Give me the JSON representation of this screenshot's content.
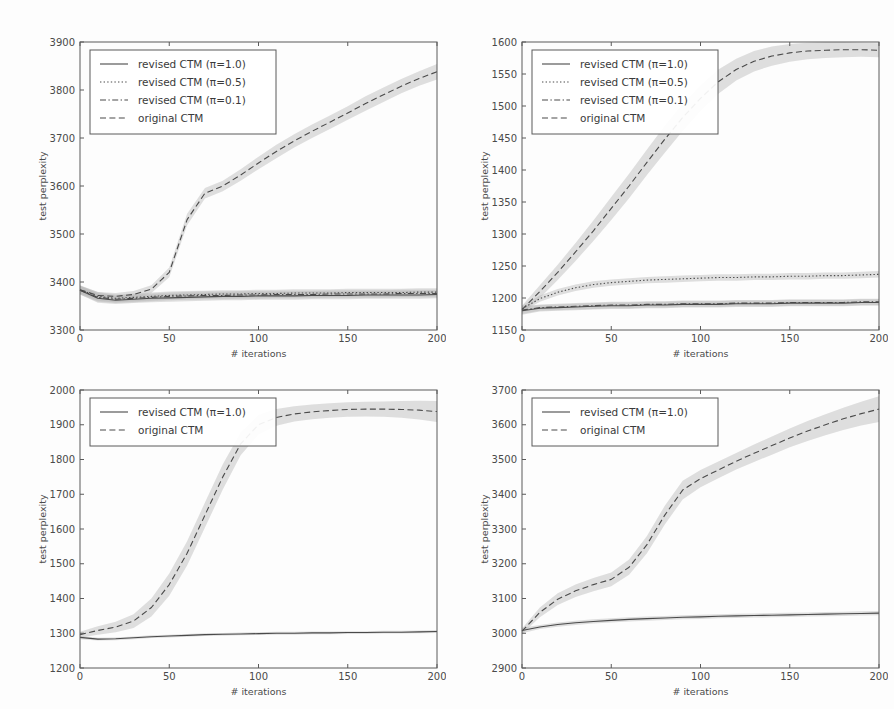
{
  "figure": {
    "background": "#fdfdfd",
    "ink_color": "#4a4a4a",
    "band_color": "#b9b9b9",
    "layout": "2x2 grid of line charts"
  },
  "axis": {
    "xlabel": "# iterations",
    "ylabel": "test perplexity",
    "xticks": [
      "0",
      "50",
      "100",
      "150",
      "200"
    ],
    "xlim": [
      0,
      200
    ]
  },
  "legend_labels": {
    "revised_1_0": "revised CTM (π=1.0)",
    "revised_0_5": "revised CTM (π=0.5)",
    "revised_0_1": "revised CTM (π=0.1)",
    "original": "original CTM"
  },
  "chart_data": [
    {
      "id": "panel-top-left",
      "type": "line",
      "title": "",
      "xlabel": "# iterations",
      "ylabel": "test perplexity",
      "xlim": [
        0,
        200
      ],
      "ylim": [
        3300,
        3900
      ],
      "xticks": [
        0,
        50,
        100,
        150,
        200
      ],
      "yticks": [
        3300,
        3400,
        3500,
        3600,
        3700,
        3800,
        3900
      ],
      "grid": false,
      "legend_position": "upper left",
      "x": [
        0,
        10,
        20,
        30,
        40,
        50,
        60,
        70,
        80,
        90,
        100,
        110,
        120,
        130,
        140,
        150,
        160,
        170,
        180,
        190,
        200
      ],
      "series": [
        {
          "name": "revised CTM (π=1.0)",
          "style": "solid",
          "values": [
            3383,
            3366,
            3362,
            3364,
            3366,
            3367,
            3368,
            3369,
            3370,
            3370,
            3371,
            3371,
            3371,
            3372,
            3372,
            3372,
            3373,
            3373,
            3373,
            3373,
            3374
          ],
          "band_lower": [
            3374,
            3357,
            3354,
            3356,
            3358,
            3359,
            3360,
            3361,
            3362,
            3362,
            3363,
            3363,
            3363,
            3364,
            3364,
            3364,
            3365,
            3365,
            3365,
            3365,
            3366
          ],
          "band_upper": [
            3392,
            3375,
            3370,
            3372,
            3374,
            3375,
            3376,
            3377,
            3378,
            3378,
            3379,
            3379,
            3379,
            3380,
            3380,
            3380,
            3381,
            3381,
            3381,
            3381,
            3382
          ]
        },
        {
          "name": "revised CTM (π=0.5)",
          "style": "dotted",
          "values": [
            3384,
            3370,
            3366,
            3368,
            3370,
            3372,
            3373,
            3374,
            3375,
            3375,
            3376,
            3376,
            3377,
            3377,
            3377,
            3378,
            3378,
            3378,
            3378,
            3379,
            3379
          ],
          "band_lower": [
            3375,
            3361,
            3358,
            3360,
            3362,
            3364,
            3365,
            3366,
            3367,
            3367,
            3368,
            3368,
            3369,
            3369,
            3369,
            3370,
            3370,
            3370,
            3370,
            3371,
            3371
          ],
          "band_upper": [
            3393,
            3379,
            3374,
            3376,
            3378,
            3380,
            3381,
            3382,
            3383,
            3383,
            3384,
            3384,
            3385,
            3385,
            3385,
            3386,
            3386,
            3386,
            3386,
            3387,
            3387
          ]
        },
        {
          "name": "revised CTM (π=0.1)",
          "style": "dashdot",
          "values": [
            3383,
            3368,
            3364,
            3366,
            3368,
            3370,
            3371,
            3372,
            3372,
            3373,
            3373,
            3374,
            3374,
            3374,
            3375,
            3375,
            3375,
            3375,
            3376,
            3376,
            3376
          ],
          "band_lower": [
            3374,
            3359,
            3356,
            3358,
            3360,
            3362,
            3363,
            3364,
            3364,
            3365,
            3365,
            3366,
            3366,
            3366,
            3367,
            3367,
            3367,
            3367,
            3368,
            3368,
            3368
          ],
          "band_upper": [
            3392,
            3377,
            3372,
            3374,
            3376,
            3378,
            3379,
            3380,
            3380,
            3381,
            3381,
            3382,
            3382,
            3382,
            3383,
            3383,
            3383,
            3383,
            3384,
            3384,
            3384
          ]
        },
        {
          "name": "original CTM",
          "style": "dashed",
          "values": [
            3384,
            3372,
            3370,
            3374,
            3385,
            3420,
            3530,
            3585,
            3600,
            3623,
            3648,
            3672,
            3694,
            3714,
            3733,
            3752,
            3772,
            3790,
            3808,
            3824,
            3838
          ],
          "band_lower": [
            3376,
            3365,
            3363,
            3367,
            3377,
            3410,
            3518,
            3574,
            3589,
            3611,
            3635,
            3658,
            3680,
            3700,
            3719,
            3738,
            3757,
            3775,
            3793,
            3809,
            3822
          ],
          "band_upper": [
            3392,
            3379,
            3377,
            3381,
            3393,
            3430,
            3542,
            3596,
            3611,
            3635,
            3661,
            3686,
            3708,
            3728,
            3747,
            3766,
            3787,
            3805,
            3823,
            3839,
            3854
          ]
        }
      ]
    },
    {
      "id": "panel-top-right",
      "type": "line",
      "title": "",
      "xlabel": "# iterations",
      "ylabel": "test perplexity",
      "xlim": [
        0,
        200
      ],
      "ylim": [
        1150,
        1600
      ],
      "xticks": [
        0,
        50,
        100,
        150,
        200
      ],
      "yticks": [
        1150,
        1200,
        1250,
        1300,
        1350,
        1400,
        1450,
        1500,
        1550,
        1600
      ],
      "grid": false,
      "legend_position": "upper left",
      "x": [
        0,
        10,
        20,
        30,
        40,
        50,
        60,
        70,
        80,
        90,
        100,
        110,
        120,
        130,
        140,
        150,
        160,
        170,
        180,
        190,
        200
      ],
      "series": [
        {
          "name": "revised CTM (π=1.0)",
          "style": "solid",
          "values": [
            1180,
            1184,
            1185,
            1186,
            1187,
            1188,
            1188,
            1189,
            1189,
            1190,
            1190,
            1190,
            1191,
            1191,
            1191,
            1192,
            1192,
            1192,
            1192,
            1193,
            1193
          ],
          "band_lower": [
            1174,
            1179,
            1180,
            1181,
            1182,
            1183,
            1183,
            1184,
            1184,
            1185,
            1185,
            1185,
            1186,
            1186,
            1186,
            1187,
            1187,
            1187,
            1187,
            1188,
            1188
          ],
          "band_upper": [
            1186,
            1189,
            1190,
            1191,
            1192,
            1193,
            1193,
            1194,
            1194,
            1195,
            1195,
            1195,
            1196,
            1196,
            1196,
            1197,
            1197,
            1197,
            1197,
            1198,
            1198
          ]
        },
        {
          "name": "revised CTM (π=0.5)",
          "style": "dotted",
          "values": [
            1183,
            1199,
            1209,
            1216,
            1221,
            1224,
            1226,
            1228,
            1229,
            1230,
            1231,
            1232,
            1232,
            1233,
            1233,
            1234,
            1234,
            1235,
            1235,
            1236,
            1237
          ],
          "band_lower": [
            1178,
            1194,
            1204,
            1211,
            1216,
            1219,
            1221,
            1223,
            1224,
            1225,
            1226,
            1227,
            1227,
            1228,
            1228,
            1229,
            1229,
            1230,
            1230,
            1231,
            1232
          ],
          "band_upper": [
            1188,
            1204,
            1214,
            1221,
            1226,
            1229,
            1231,
            1233,
            1234,
            1235,
            1236,
            1237,
            1237,
            1238,
            1238,
            1239,
            1239,
            1240,
            1240,
            1241,
            1242
          ]
        },
        {
          "name": "revised CTM (π=0.1)",
          "style": "dashdot",
          "values": [
            1181,
            1185,
            1186,
            1187,
            1188,
            1189,
            1189,
            1190,
            1190,
            1191,
            1191,
            1191,
            1192,
            1192,
            1192,
            1193,
            1193,
            1193,
            1193,
            1194,
            1194
          ],
          "band_lower": [
            1175,
            1180,
            1181,
            1182,
            1183,
            1184,
            1184,
            1185,
            1185,
            1186,
            1186,
            1186,
            1187,
            1187,
            1187,
            1188,
            1188,
            1188,
            1188,
            1189,
            1189
          ],
          "band_upper": [
            1187,
            1190,
            1191,
            1192,
            1193,
            1194,
            1194,
            1195,
            1195,
            1196,
            1196,
            1196,
            1197,
            1197,
            1197,
            1198,
            1198,
            1198,
            1198,
            1199,
            1199
          ]
        },
        {
          "name": "original CTM",
          "style": "dashed",
          "values": [
            1182,
            1210,
            1240,
            1272,
            1305,
            1340,
            1375,
            1412,
            1448,
            1482,
            1512,
            1538,
            1557,
            1570,
            1578,
            1583,
            1586,
            1587,
            1588,
            1588,
            1587
          ],
          "band_lower": [
            1176,
            1200,
            1228,
            1258,
            1289,
            1322,
            1356,
            1392,
            1427,
            1461,
            1492,
            1519,
            1540,
            1554,
            1563,
            1569,
            1573,
            1575,
            1576,
            1577,
            1576
          ],
          "band_upper": [
            1188,
            1220,
            1252,
            1286,
            1321,
            1358,
            1394,
            1432,
            1469,
            1503,
            1532,
            1557,
            1574,
            1586,
            1593,
            1597,
            1599,
            1600,
            1600,
            1599,
            1598
          ]
        }
      ]
    },
    {
      "id": "panel-bottom-left",
      "type": "line",
      "title": "",
      "xlabel": "# iterations",
      "ylabel": "test perplexity",
      "xlim": [
        0,
        200
      ],
      "ylim": [
        1200,
        2000
      ],
      "xticks": [
        0,
        50,
        100,
        150,
        200
      ],
      "yticks": [
        1200,
        1300,
        1400,
        1500,
        1600,
        1700,
        1800,
        1900,
        2000
      ],
      "grid": false,
      "legend_position": "upper left",
      "x": [
        0,
        10,
        20,
        30,
        40,
        50,
        60,
        70,
        80,
        90,
        100,
        110,
        120,
        130,
        140,
        150,
        160,
        170,
        180,
        190,
        200
      ],
      "series": [
        {
          "name": "revised CTM (π=1.0)",
          "style": "solid",
          "values": [
            1288,
            1283,
            1284,
            1287,
            1290,
            1292,
            1294,
            1296,
            1297,
            1298,
            1299,
            1300,
            1300,
            1301,
            1301,
            1302,
            1302,
            1303,
            1303,
            1304,
            1305
          ],
          "band_lower": [
            1283,
            1279,
            1280,
            1283,
            1286,
            1288,
            1290,
            1292,
            1293,
            1294,
            1295,
            1296,
            1296,
            1297,
            1297,
            1298,
            1298,
            1299,
            1299,
            1300,
            1301
          ],
          "band_upper": [
            1293,
            1287,
            1288,
            1291,
            1294,
            1296,
            1298,
            1300,
            1301,
            1302,
            1303,
            1304,
            1304,
            1305,
            1305,
            1306,
            1306,
            1307,
            1307,
            1308,
            1309
          ]
        },
        {
          "name": "original CTM",
          "style": "dashed",
          "values": [
            1296,
            1308,
            1318,
            1335,
            1374,
            1440,
            1530,
            1640,
            1750,
            1845,
            1900,
            1921,
            1931,
            1937,
            1941,
            1944,
            1945,
            1945,
            1944,
            1942,
            1938
          ],
          "band_lower": [
            1288,
            1296,
            1303,
            1315,
            1348,
            1408,
            1495,
            1604,
            1714,
            1812,
            1872,
            1897,
            1909,
            1916,
            1920,
            1923,
            1924,
            1923,
            1920,
            1915,
            1908
          ],
          "band_upper": [
            1304,
            1320,
            1333,
            1355,
            1400,
            1472,
            1565,
            1676,
            1786,
            1878,
            1928,
            1945,
            1953,
            1958,
            1962,
            1965,
            1966,
            1967,
            1968,
            1969,
            1968
          ]
        }
      ]
    },
    {
      "id": "panel-bottom-right",
      "type": "line",
      "title": "",
      "xlabel": "# iterations",
      "ylabel": "test perplexity",
      "xlim": [
        0,
        200
      ],
      "ylim": [
        2900,
        3700
      ],
      "xticks": [
        0,
        50,
        100,
        150,
        200
      ],
      "yticks": [
        2900,
        3000,
        3100,
        3200,
        3300,
        3400,
        3500,
        3600,
        3700
      ],
      "grid": false,
      "legend_position": "upper left",
      "x": [
        0,
        10,
        20,
        30,
        40,
        50,
        60,
        70,
        80,
        90,
        100,
        110,
        120,
        130,
        140,
        150,
        160,
        170,
        180,
        190,
        200
      ],
      "series": [
        {
          "name": "revised CTM (π=1.0)",
          "style": "solid",
          "values": [
            3008,
            3018,
            3025,
            3030,
            3034,
            3037,
            3040,
            3042,
            3044,
            3046,
            3047,
            3049,
            3050,
            3051,
            3052,
            3053,
            3054,
            3055,
            3056,
            3057,
            3058
          ],
          "band_lower": [
            3000,
            3012,
            3019,
            3024,
            3028,
            3031,
            3034,
            3036,
            3038,
            3040,
            3041,
            3043,
            3044,
            3045,
            3046,
            3047,
            3048,
            3049,
            3050,
            3051,
            3052
          ],
          "band_upper": [
            3016,
            3024,
            3031,
            3036,
            3040,
            3043,
            3046,
            3048,
            3050,
            3052,
            3053,
            3055,
            3056,
            3057,
            3058,
            3059,
            3060,
            3061,
            3062,
            3063,
            3064
          ]
        },
        {
          "name": "original CTM",
          "style": "dashed",
          "values": [
            3006,
            3060,
            3098,
            3122,
            3140,
            3155,
            3190,
            3255,
            3340,
            3412,
            3445,
            3470,
            3495,
            3518,
            3540,
            3562,
            3582,
            3600,
            3617,
            3632,
            3645
          ],
          "band_lower": [
            2998,
            3046,
            3081,
            3104,
            3121,
            3135,
            3168,
            3230,
            3313,
            3385,
            3420,
            3446,
            3471,
            3493,
            3514,
            3535,
            3553,
            3570,
            3585,
            3598,
            3608
          ],
          "band_upper": [
            3014,
            3074,
            3115,
            3140,
            3159,
            3175,
            3212,
            3280,
            3367,
            3439,
            3470,
            3494,
            3519,
            3543,
            3566,
            3589,
            3611,
            3630,
            3649,
            3666,
            3682
          ]
        }
      ]
    }
  ]
}
